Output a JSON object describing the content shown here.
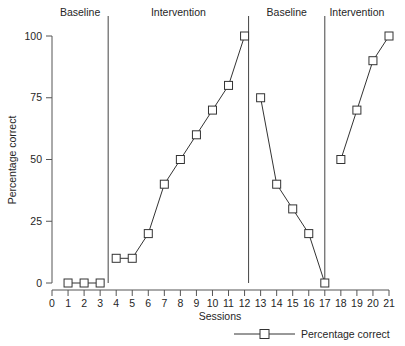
{
  "chart_data": {
    "type": "line",
    "title": "",
    "xlabel": "Sessions",
    "ylabel": "Percentage correct",
    "xlim": [
      0,
      21
    ],
    "ylim": [
      0,
      100
    ],
    "grid": false,
    "legend_position": "bottom-right",
    "series": [
      {
        "name": "Percentage correct",
        "marker": "open-square",
        "color": "#333333",
        "x": [
          1,
          2,
          3,
          4,
          5,
          6,
          7,
          8,
          9,
          10,
          11,
          12,
          13,
          14,
          15,
          16,
          17,
          18,
          19,
          20,
          21
        ],
        "values": [
          0,
          0,
          0,
          10,
          10,
          20,
          40,
          50,
          60,
          70,
          80,
          100,
          75,
          40,
          30,
          20,
          0,
          50,
          70,
          90,
          100
        ]
      }
    ],
    "x_ticks": [
      "0",
      "1",
      "2",
      "3",
      "4",
      "5",
      "6",
      "7",
      "8",
      "9",
      "10",
      "11",
      "12",
      "13",
      "14",
      "15",
      "16",
      "17",
      "18",
      "19",
      "20",
      "21"
    ],
    "y_ticks": [
      "0",
      "25",
      "50",
      "75",
      "100"
    ],
    "y_tick_values": [
      0,
      25,
      50,
      75,
      100
    ],
    "phases": [
      {
        "label": "Baseline",
        "start": 0.0,
        "end": 3.5
      },
      {
        "label": "Intervention",
        "start": 3.5,
        "end": 12.25
      },
      {
        "label": "Baseline",
        "start": 12.25,
        "end": 17.0
      },
      {
        "label": "Intervention",
        "start": 17.0,
        "end": 21.0
      }
    ],
    "phase_dividers": [
      3.5,
      12.25,
      17.0
    ],
    "legend": [
      {
        "label": "Percentage correct",
        "marker": "open-square"
      }
    ]
  },
  "axes": {
    "x_title": "Sessions",
    "y_title": "Percentage correct"
  }
}
